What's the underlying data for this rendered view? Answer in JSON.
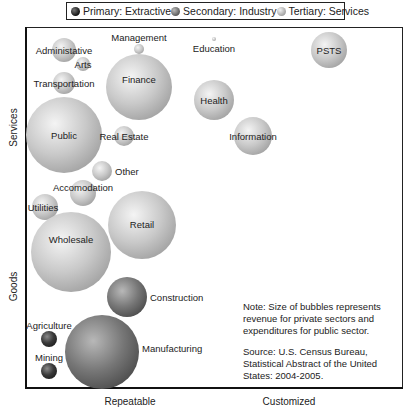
{
  "legend": {
    "items": [
      {
        "label": "Primary: Extractive",
        "color": "#1a1a1a"
      },
      {
        "label": "Secondary: Industry",
        "color": "#6e6e6e"
      },
      {
        "label": "Tertiary: Services",
        "color": "#c8c8c8"
      }
    ]
  },
  "axes": {
    "y_top_label": "Services",
    "y_bottom_label": "Goods",
    "x_left_label": "Repeatable",
    "x_right_label": "Customized"
  },
  "note": {
    "line1": "Note:  Size of bubbles represents revenue for private sectors and expenditures for public sector.",
    "line2": "Source:  U.S. Census Bureau, Statistical Abstract of the United States: 2004-2005."
  },
  "chart_data": {
    "type": "scatter",
    "subtype": "bubble",
    "title": "",
    "xlabel": "Repeatable → Customized",
    "ylabel": "Goods → Services",
    "legend_position": "top",
    "grid": false,
    "series": [
      {
        "name": "Primary: Extractive",
        "color": "#1a1a1a",
        "points": [
          {
            "label": "Agriculture",
            "x": 49,
            "y": 339,
            "r": 8
          },
          {
            "label": "Mining",
            "x": 49,
            "y": 371,
            "r": 8
          }
        ]
      },
      {
        "name": "Secondary: Industry",
        "color": "#6e6e6e",
        "points": [
          {
            "label": "Construction",
            "x": 127,
            "y": 297,
            "r": 20
          },
          {
            "label": "Manufacturing",
            "x": 102,
            "y": 352,
            "r": 37
          }
        ]
      },
      {
        "name": "Tertiary: Services",
        "color": "#c8c8c8",
        "points": [
          {
            "label": "Administative",
            "x": 64,
            "y": 50,
            "r": 12
          },
          {
            "label": "Arts",
            "x": 83,
            "y": 64,
            "r": 7
          },
          {
            "label": "Transportation",
            "x": 64,
            "y": 83,
            "r": 11
          },
          {
            "label": "Management",
            "x": 139,
            "y": 49,
            "r": 5
          },
          {
            "label": "Finance",
            "x": 139,
            "y": 87,
            "r": 33
          },
          {
            "label": "Education",
            "x": 214,
            "y": 39,
            "r": 2
          },
          {
            "label": "PSTS",
            "x": 329,
            "y": 50,
            "r": 18
          },
          {
            "label": "Health",
            "x": 214,
            "y": 100,
            "r": 20
          },
          {
            "label": "Information",
            "x": 253,
            "y": 136,
            "r": 19
          },
          {
            "label": "Public",
            "x": 64,
            "y": 135,
            "r": 38
          },
          {
            "label": "Real Estate",
            "x": 124,
            "y": 136,
            "r": 10
          },
          {
            "label": "Other",
            "x": 102,
            "y": 171,
            "r": 10
          },
          {
            "label": "Accomodation",
            "x": 83,
            "y": 193,
            "r": 13
          },
          {
            "label": "Utilities",
            "x": 45,
            "y": 207,
            "r": 13
          },
          {
            "label": "Retail",
            "x": 142,
            "y": 225,
            "r": 34
          },
          {
            "label": "Wholesale",
            "x": 71,
            "y": 252,
            "r": 40
          }
        ]
      }
    ]
  }
}
